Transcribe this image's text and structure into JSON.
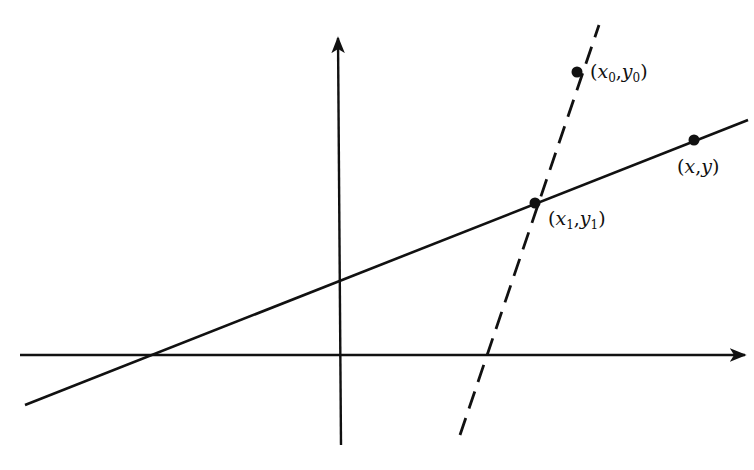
{
  "diagram": {
    "type": "coordinate-geometry",
    "stroke_color": "#111111",
    "background": "#ffffff",
    "axes": {
      "x_axis": {
        "x1": 20,
        "y1": 355,
        "x2": 745,
        "y2": 355,
        "arrow": "right"
      },
      "y_axis": {
        "x1": 341,
        "y1": 445,
        "x2": 338,
        "y2": 38,
        "arrow": "up"
      }
    },
    "lines": [
      {
        "name": "solid-line",
        "style": "solid",
        "x1": 25,
        "y1": 405,
        "x2": 748,
        "y2": 120
      },
      {
        "name": "dashed-line",
        "style": "dashed",
        "x1": 460,
        "y1": 435,
        "x2": 599,
        "y2": 25
      }
    ],
    "points": [
      {
        "name": "point-x0-y0",
        "cx": 577,
        "cy": 72,
        "label_var_x": "x",
        "label_sub_x": "0",
        "label_var_y": "y",
        "label_sub_y": "0",
        "label_x": 588,
        "label_y": 62
      },
      {
        "name": "point-x-y",
        "cx": 694,
        "cy": 140,
        "label_var_x": "x",
        "label_sub_x": "",
        "label_var_y": "y",
        "label_sub_y": "",
        "label_x": 676,
        "label_y": 158
      },
      {
        "name": "point-x1-y1",
        "cx": 535,
        "cy": 203,
        "label_var_x": "x",
        "label_sub_x": "1",
        "label_var_y": "y",
        "label_sub_y": "1",
        "label_x": 548,
        "label_y": 208
      }
    ],
    "labels": {
      "p0": {
        "open": "(",
        "vx": "x",
        "sx": "0",
        "comma": ",",
        "vy": "y",
        "sy": "0",
        "close": ")"
      },
      "p": {
        "open": "(",
        "vx": "x",
        "comma": ",",
        "vy": "y",
        "close": ")"
      },
      "p1": {
        "open": "(",
        "vx": "x",
        "sx": "1",
        "comma": ",",
        "vy": "y",
        "sy": "1",
        "close": ")"
      }
    }
  }
}
